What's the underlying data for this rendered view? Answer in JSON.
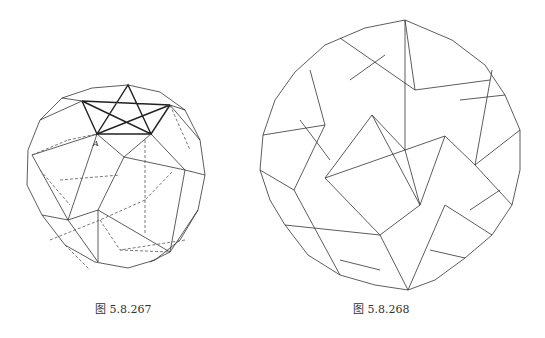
{
  "figures": [
    {
      "caption": "图 5.8.267",
      "description": "polyhedron wireframe with hidden dashed edges",
      "vertex_label": "A"
    },
    {
      "caption": "图 5.8.268",
      "description": "stellated polyhedron wireframe"
    }
  ],
  "colors": {
    "line": "#333333",
    "background": "#ffffff"
  }
}
